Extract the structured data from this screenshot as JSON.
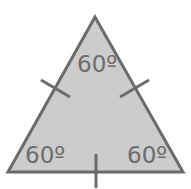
{
  "diagram": {
    "fill_color": "#cccccc",
    "stroke_color": "#6b6b6b",
    "text_color": "#6b6b6b",
    "angles": {
      "top": "60º",
      "bottom_left": "60º",
      "bottom_right": "60º"
    },
    "tick_marks": [
      "left-side",
      "right-side",
      "base"
    ]
  }
}
